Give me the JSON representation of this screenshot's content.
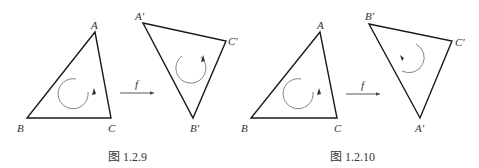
{
  "figures": [
    {
      "caption": "图 1.2.9",
      "source_triangle": {
        "labels": {
          "A": "A",
          "B": "B",
          "C": "C"
        },
        "orientation": "clockwise"
      },
      "map_label": "f",
      "image_triangle": {
        "labels": {
          "top_left": "A′",
          "right": "C′",
          "bottom": "B′"
        },
        "orientation": "clockwise"
      }
    },
    {
      "caption": "图 1.2.10",
      "source_triangle": {
        "labels": {
          "A": "A",
          "B": "B",
          "C": "C"
        },
        "orientation": "clockwise"
      },
      "map_label": "f",
      "image_triangle": {
        "labels": {
          "top_left": "B′",
          "right": "C′",
          "bottom": "A′"
        },
        "orientation": "counterclockwise"
      }
    }
  ],
  "colors": {
    "stroke": "#1a1a1a",
    "orientation_arc": "#777777",
    "text": "#333333"
  }
}
